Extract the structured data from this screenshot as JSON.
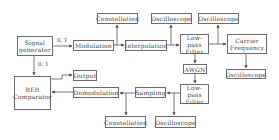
{
  "diagram": {
    "nodes": {
      "signal_generator": "Signal generator",
      "modulation": "Modulation",
      "constellation_top": "Constellation",
      "interpolation": "Interpolation",
      "oscilloscope_top1": "Oscilloscope",
      "lowpass_top": "Low-pass Filter",
      "oscilloscope_top2": "Oscilloscope",
      "carrier_frequency": "Carrier Frequency",
      "awgn": "AWGN",
      "oscilloscope_right": "Oscilloscope",
      "ber_comparator": "BER Comparator",
      "output": "Output",
      "demodulation": "Demodulation",
      "sampling": "Sampling",
      "lowpass_bottom": "Low-pass Filter",
      "constellation_bottom": "Constellation",
      "oscilloscope_bottom": "Oscilloscope"
    },
    "edge_labels": {
      "gen_to_mod": "0, 1",
      "gen_to_ber": "0, 1"
    },
    "colors": {
      "line": "#555555",
      "border": "#6b6b6b",
      "text": "#444444"
    }
  }
}
